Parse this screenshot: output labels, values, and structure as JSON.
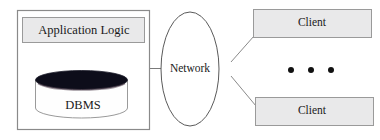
{
  "diagram": {
    "type": "architecture-block-diagram",
    "background_color": "#ffffff",
    "server": {
      "container_label": "",
      "border_color": "#8a8a8a",
      "fill_color": "#ffffff",
      "application_logic": {
        "label": "Application Logic",
        "fill_color": "#e9e9ea",
        "border_color": "#9a9a9a"
      },
      "dbms": {
        "label": "DBMS",
        "body_fill_color": "#fefefe",
        "top_fill_color": "#0d0d1a",
        "border_color": "#9a9a9a"
      }
    },
    "network": {
      "label": "Network",
      "shape": "ellipse",
      "fill_color": "#ffffff",
      "border_color": "#5a5a5a"
    },
    "clients": [
      {
        "label": "Client",
        "position": "top",
        "fill_color": "#e9e9ea",
        "border_color": "#9a9a9a"
      },
      {
        "label": "Client",
        "position": "bottom",
        "fill_color": "#e9e9ea",
        "border_color": "#9a9a9a"
      }
    ],
    "ellipsis": {
      "label": "...",
      "dot_count": 3,
      "dot_color": "#111111"
    },
    "connectors": [
      {
        "from": "server",
        "to": "network",
        "style": "straight"
      },
      {
        "from": "network",
        "to": "client-top",
        "style": "diagonal"
      },
      {
        "from": "network",
        "to": "client-bottom",
        "style": "diagonal"
      }
    ],
    "line_color": "#7a7a7a"
  }
}
